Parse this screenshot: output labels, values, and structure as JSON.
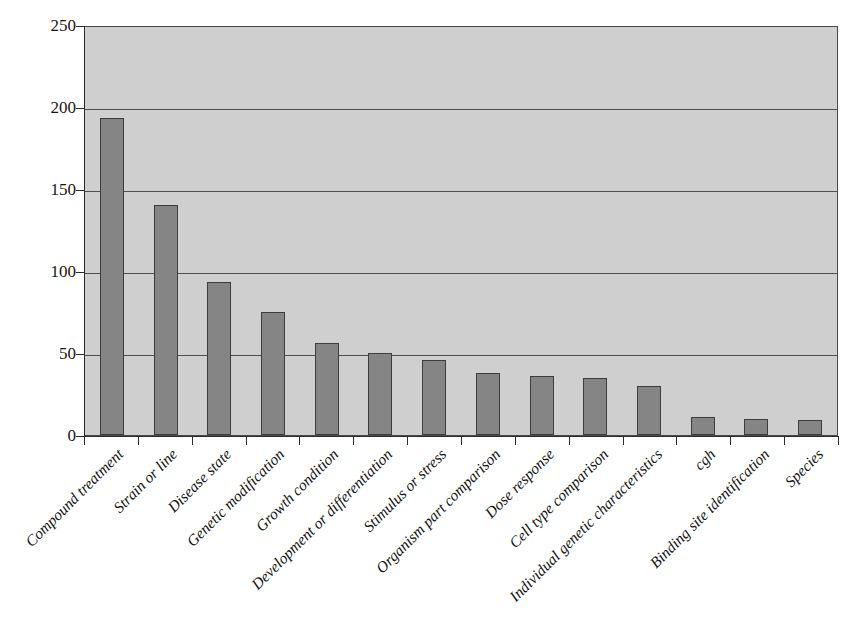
{
  "chart_data": {
    "type": "bar",
    "title": "",
    "subtitle": "",
    "xlabel": "",
    "ylabel": "",
    "ylim": [
      0,
      250
    ],
    "yticks": [
      0,
      50,
      100,
      150,
      200,
      250
    ],
    "grid": "horizontal",
    "legend": "none",
    "bar_color": "#858585",
    "bar_edge_color": "#3d3d3d",
    "plot_background": "#cfcfcf",
    "axis_color": "#2b2b2b",
    "categories": [
      "Compound treatment",
      "Strain or line",
      "Disease state",
      "Genetic modification",
      "Growth condition",
      "Development or differentiation",
      "Stimulus or stress",
      "Organism part comparison",
      "Dose response",
      "Cell type comparison",
      "Individual genetic characteristics",
      "cgh",
      "Binding site identification",
      "Species"
    ],
    "values": [
      193,
      140,
      93,
      75,
      56,
      50,
      46,
      38,
      36,
      35,
      30,
      11,
      10,
      9
    ]
  }
}
